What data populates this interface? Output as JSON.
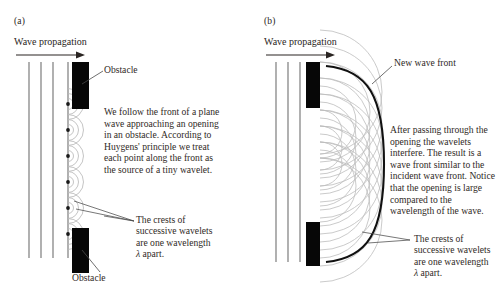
{
  "figure": {
    "type": "physics-diagram"
  },
  "panel_a": {
    "label": "(a)",
    "propagation_label": "Wave propagation",
    "obstacle_top_label": "Obstacle",
    "obstacle_bottom_label": "Obstacle",
    "body_text": "We follow the front of a plane wave approaching an opening in an obstacle. According to Huygens' principle we treat each point along the front as the source of a tiny wavelet.",
    "crest_text_line1": "The crests of",
    "crest_text_line2": "successive wavelets",
    "crest_text_line3": "are one wavelength",
    "crest_text_line4_pre": "λ",
    "crest_text_line4_post": " apart.",
    "wavefront_line_count": 3,
    "wavelet_source_count": 6,
    "arcs_per_wavelet": 3
  },
  "panel_b": {
    "label": "(b)",
    "propagation_label": "Wave propagation",
    "new_wave_front_label": "New wave front",
    "body_text": "After passing through the opening the wavelets interfere. The result is a wave front similar to the incident wave front. Notice that the opening is large compared to the wavelength of the wave.",
    "crest_text_line1": "The crests of",
    "crest_text_line2": "successive wavelets",
    "crest_text_line3": "are one wavelength",
    "crest_text_line4_pre": "λ",
    "crest_text_line4_post": " apart.",
    "wavefront_line_count": 3,
    "wavelet_source_count": 9
  },
  "colors": {
    "ink": "#231f1c",
    "obstacle": "#070707",
    "wavefront_line": "#5c5c5c",
    "wavelet_arc": "#b3b3b3",
    "new_front": "#111111",
    "leader": "#4a4a4a"
  }
}
